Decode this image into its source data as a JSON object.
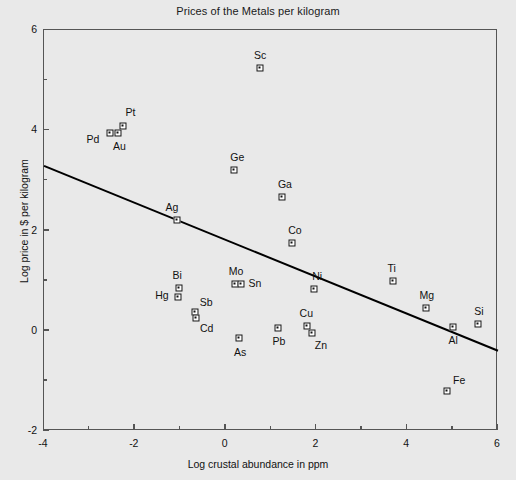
{
  "chart_data": {
    "type": "scatter",
    "title": "Prices of the Metals per kilogram",
    "xlabel": "Log crustal abundance in ppm",
    "ylabel": "Log price in $ per kilogram",
    "xlim": [
      -4,
      6
    ],
    "ylim": [
      -2,
      6
    ],
    "xticks": [
      -4,
      -2,
      0,
      2,
      4,
      6
    ],
    "yticks": [
      -2,
      0,
      2,
      4,
      6
    ],
    "xtick_labels": [
      "-4",
      "-2",
      "0",
      "2",
      "4",
      "6"
    ],
    "ytick_labels": [
      "-2",
      "0",
      "2",
      "4",
      "6"
    ],
    "xminor_ticks": [
      -3,
      -1,
      1,
      3,
      5
    ],
    "yminor_ticks": [
      -1,
      1,
      3,
      5
    ],
    "grid": false,
    "legend": null,
    "points": [
      {
        "label": "Sc",
        "x": 0.76,
        "y": 5.24,
        "label_dx": 0,
        "label_dy": -13
      },
      {
        "label": "Pt",
        "x": -2.25,
        "y": 4.08,
        "label_dx": 7,
        "label_dy": -14
      },
      {
        "label": "Pd",
        "x": -2.55,
        "y": 3.94,
        "label_dx": -17,
        "label_dy": 6
      },
      {
        "label": "Au",
        "x": -2.36,
        "y": 3.94,
        "label_dx": 1,
        "label_dy": 13
      },
      {
        "label": "Ge",
        "x": 0.19,
        "y": 3.21,
        "label_dx": 3,
        "label_dy": -13
      },
      {
        "label": "Ga",
        "x": 1.24,
        "y": 2.67,
        "label_dx": 3,
        "label_dy": -13
      },
      {
        "label": "Ag",
        "x": -1.07,
        "y": 2.21,
        "label_dx": -5,
        "label_dy": -13
      },
      {
        "label": "Co",
        "x": 1.46,
        "y": 1.75,
        "label_dx": 3,
        "label_dy": -13
      },
      {
        "label": "Ti",
        "x": 3.68,
        "y": 1.0,
        "label_dx": -1,
        "label_dy": -13
      },
      {
        "label": "Ni",
        "x": 1.95,
        "y": 0.84,
        "label_dx": 3,
        "label_dy": -13
      },
      {
        "label": "Mo",
        "x": 0.21,
        "y": 0.94,
        "label_dx": 1,
        "label_dy": -13
      },
      {
        "label": "Sn",
        "x": 0.34,
        "y": 0.94,
        "label_dx": 14,
        "label_dy": -1
      },
      {
        "label": "Bi",
        "x": -1.02,
        "y": 0.86,
        "label_dx": -2,
        "label_dy": -13
      },
      {
        "label": "Hg",
        "x": -1.05,
        "y": 0.67,
        "label_dx": -16,
        "label_dy": -2
      },
      {
        "label": "Mg",
        "x": 4.41,
        "y": 0.46,
        "label_dx": 1,
        "label_dy": -13
      },
      {
        "label": "Si",
        "x": 5.56,
        "y": 0.14,
        "label_dx": 1,
        "label_dy": -13
      },
      {
        "label": "Cu",
        "x": 1.8,
        "y": 0.09,
        "label_dx": -1,
        "label_dy": -13
      },
      {
        "label": "Zn",
        "x": 1.9,
        "y": -0.05,
        "label_dx": 9,
        "label_dy": 12
      },
      {
        "label": "Sb",
        "x": -0.67,
        "y": 0.37,
        "label_dx": 11,
        "label_dy": -10
      },
      {
        "label": "Cd",
        "x": -0.66,
        "y": 0.25,
        "label_dx": 11,
        "label_dy": 10
      },
      {
        "label": "Pb",
        "x": 1.15,
        "y": 0.06,
        "label_dx": 1,
        "label_dy": 13
      },
      {
        "label": "Al",
        "x": 5.01,
        "y": 0.08,
        "label_dx": 0,
        "label_dy": 13
      },
      {
        "label": "As",
        "x": 0.3,
        "y": -0.14,
        "label_dx": 1,
        "label_dy": 14
      },
      {
        "label": "Fe",
        "x": 4.88,
        "y": -1.2,
        "label_dx": 12,
        "label_dy": -11
      }
    ],
    "trend_line": {
      "x0": -4,
      "y0": 3.29,
      "x1": 6,
      "y1": -0.4,
      "color": "#000000",
      "width": 2
    }
  },
  "colors": {
    "background": "#e9e9e9",
    "axis": "#555555",
    "marker_fill": "#ffffff",
    "marker_edge": "#111111",
    "text": "#111111"
  }
}
